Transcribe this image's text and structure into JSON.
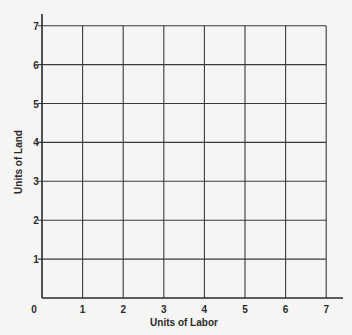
{
  "chart_data": {
    "type": "line",
    "title": "",
    "xlabel": "Units of Labor",
    "ylabel": "Units of Land",
    "x_ticks": [
      "0",
      "1",
      "2",
      "3",
      "4",
      "5",
      "6",
      "7"
    ],
    "y_ticks": [
      "1",
      "2",
      "3",
      "4",
      "5",
      "6",
      "7"
    ],
    "xlim": [
      0,
      7
    ],
    "ylim": [
      0,
      7
    ],
    "grid": true,
    "series": [],
    "legend": null
  },
  "colors": {
    "background": "#f5f5f3",
    "grid": "#3a3a3a",
    "axis": "#2a2a2a"
  }
}
